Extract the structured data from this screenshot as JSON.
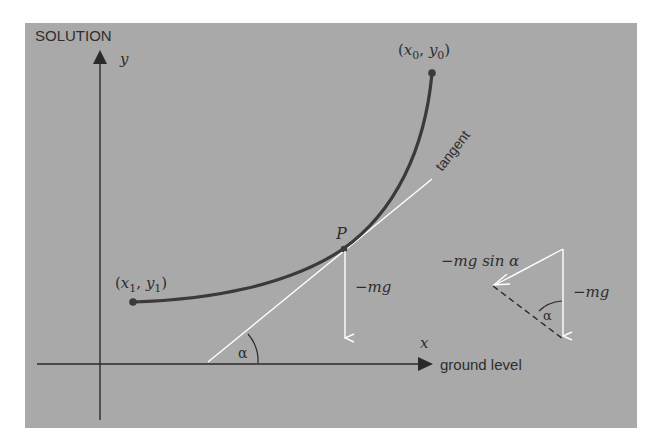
{
  "figure": {
    "title": "SOLUTION",
    "background_color": "#a9a9a9",
    "curve_color": "#3a3a3a",
    "vector_color": "#ffffff",
    "axis_color": "#2a2a2a"
  },
  "axes": {
    "y_label": "y",
    "x_label": "x",
    "ground_label": "ground level"
  },
  "points": {
    "start": {
      "label": "(x₀, y₀)",
      "x_sym": "x",
      "x_sub": "0",
      "y_sym": "y",
      "y_sub": "0"
    },
    "end": {
      "label": "(x₁, y₁)",
      "x_sym": "x",
      "x_sub": "1",
      "y_sym": "y",
      "y_sub": "1"
    },
    "P": {
      "label": "P"
    }
  },
  "labels": {
    "tangent": "tangent",
    "alpha": "α",
    "weight": "−mg",
    "weight_component": "−mg sin α",
    "triangle_alpha": "α",
    "triangle_weight": "−mg"
  }
}
